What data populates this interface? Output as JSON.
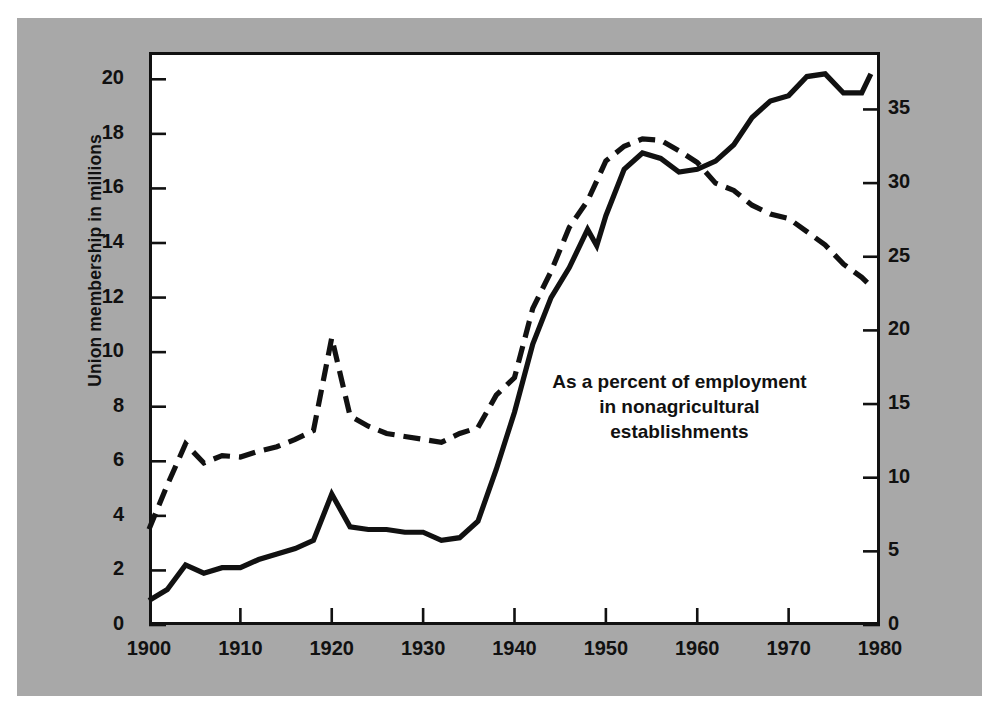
{
  "figure": {
    "background_color": "#a8a8a8",
    "plot_background_color": "#ffffff",
    "line_color": "#111111"
  },
  "axes": {
    "left_title": "Union membership in millions",
    "right_title": "Percent of employment in nonagricultural establishments",
    "left_ticks": [
      "0",
      "2",
      "4",
      "6",
      "8",
      "10",
      "12",
      "14",
      "16",
      "18",
      "20"
    ],
    "right_ticks": [
      "0",
      "5",
      "10",
      "15",
      "20",
      "25",
      "30",
      "35"
    ],
    "x_ticks": [
      "1900",
      "1910",
      "1920",
      "1930",
      "1940",
      "1950",
      "1960",
      "1970",
      "1980"
    ]
  },
  "annotation": {
    "line1": "As a percent of employment",
    "line2": "in nonagricultural",
    "line3": "establishments"
  },
  "chart_data": {
    "type": "line",
    "title": "",
    "xlabel": "",
    "ylabel": "Union membership in millions",
    "y2label": "Percent of employment in nonagricultural establishments",
    "xlim": [
      1900,
      1980
    ],
    "ylim": [
      0,
      21
    ],
    "y2lim": [
      0,
      38.9
    ],
    "grid": false,
    "legend": "annotation-in-plot",
    "series": [
      {
        "name": "Union membership in millions",
        "axis": "left",
        "style": "solid",
        "x": [
          1900,
          1902,
          1904,
          1906,
          1908,
          1910,
          1912,
          1914,
          1916,
          1918,
          1920,
          1922,
          1924,
          1926,
          1928,
          1930,
          1932,
          1934,
          1936,
          1938,
          1940,
          1942,
          1944,
          1946,
          1948,
          1949,
          1950,
          1952,
          1954,
          1956,
          1958,
          1960,
          1962,
          1964,
          1966,
          1968,
          1970,
          1972,
          1974,
          1976,
          1978,
          1979
        ],
        "values": [
          0.9,
          1.3,
          2.2,
          1.9,
          2.1,
          2.1,
          2.4,
          2.6,
          2.8,
          3.1,
          4.8,
          3.6,
          3.5,
          3.5,
          3.4,
          3.4,
          3.1,
          3.2,
          3.8,
          5.7,
          7.8,
          10.3,
          12.0,
          13.1,
          14.5,
          13.9,
          15.0,
          16.7,
          17.3,
          17.1,
          16.6,
          16.7,
          17.0,
          17.6,
          18.6,
          19.2,
          19.4,
          20.1,
          20.2,
          19.5,
          19.5,
          20.2
        ]
      },
      {
        "name": "Percent of employment in nonagricultural establishments",
        "axis": "right",
        "style": "dashed",
        "x": [
          1900,
          1902,
          1904,
          1906,
          1908,
          1910,
          1912,
          1914,
          1916,
          1918,
          1920,
          1922,
          1924,
          1926,
          1928,
          1930,
          1932,
          1934,
          1936,
          1938,
          1940,
          1942,
          1944,
          1946,
          1948,
          1950,
          1952,
          1954,
          1956,
          1958,
          1960,
          1962,
          1964,
          1966,
          1968,
          1970,
          1972,
          1974,
          1976,
          1978,
          1979
        ],
        "values": [
          6.5,
          9.5,
          12.3,
          11.0,
          11.5,
          11.4,
          11.8,
          12.1,
          12.6,
          13.2,
          19.5,
          14.2,
          13.5,
          13.0,
          12.8,
          12.6,
          12.4,
          13.0,
          13.4,
          15.6,
          16.8,
          21.5,
          24.0,
          27.0,
          28.8,
          31.5,
          32.5,
          33.0,
          32.9,
          32.2,
          31.4,
          30.0,
          29.5,
          28.5,
          27.9,
          27.6,
          26.7,
          25.8,
          24.5,
          23.6,
          23.0
        ]
      }
    ]
  }
}
